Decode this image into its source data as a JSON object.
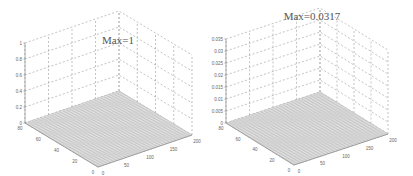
{
  "chart_data": [
    {
      "type": "surface3d",
      "title": "",
      "annotation": "Max=1",
      "xlabel": "",
      "ylabel": "",
      "zlabel": "",
      "z_ticks": [
        "0",
        "0.2",
        "0.4",
        "0.6",
        "0.8",
        "1"
      ],
      "zlim": [
        0,
        1
      ],
      "x_ticks": [
        "0",
        "50",
        "100",
        "150",
        "200"
      ],
      "xlim": [
        0,
        200
      ],
      "y_ticks": [
        "0",
        "20",
        "40",
        "60",
        "80"
      ],
      "ylim": [
        0,
        80
      ],
      "grid": true,
      "description": "Near-flat surface mesh close to z=0 across the full x-y domain"
    },
    {
      "type": "surface3d",
      "title": "",
      "annotation": "Max=0.0317",
      "xlabel": "",
      "ylabel": "",
      "zlabel": "",
      "z_ticks": [
        "0",
        "0.005",
        "0.01",
        "0.015",
        "0.02",
        "0.025",
        "0.03",
        "0.035"
      ],
      "zlim": [
        0,
        0.035
      ],
      "x_ticks": [
        "0",
        "50",
        "100",
        "150",
        "200"
      ],
      "xlim": [
        0,
        200
      ],
      "y_ticks": [
        "0",
        "20",
        "40",
        "60",
        "80"
      ],
      "ylim": [
        0,
        80
      ],
      "grid": true,
      "description": "Near-flat surface mesh close to z=0 across the full x-y domain"
    }
  ],
  "left": {
    "max_label": "Max=1",
    "z_ticks": [
      "0",
      "0.2",
      "0.4",
      "0.6",
      "0.8",
      "1"
    ],
    "x_ticks": [
      "0",
      "50",
      "100",
      "150",
      "200"
    ],
    "y_ticks": [
      "0",
      "20",
      "40",
      "60",
      "80"
    ]
  },
  "right": {
    "max_label": "Max=0.0317",
    "z_ticks": [
      "0",
      "0.005",
      "0.01",
      "0.015",
      "0.02",
      "0.025",
      "0.03",
      "0.035"
    ],
    "x_ticks": [
      "0",
      "50",
      "100",
      "150",
      "200"
    ],
    "y_ticks": [
      "0",
      "20",
      "40",
      "60",
      "80"
    ]
  }
}
